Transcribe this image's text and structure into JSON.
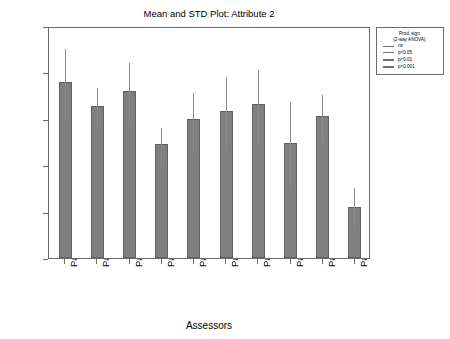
{
  "chart_data": {
    "type": "bar",
    "title": "Mean and STD Plot: Attribute 2",
    "xlabel": "Assessors",
    "ylabel": "Score",
    "ylim": [
      0,
      100
    ],
    "yticks": [
      0,
      20,
      40,
      60,
      80,
      100
    ],
    "grid": false,
    "legend_position": "outside-top-right",
    "categories": [
      "Panellist 1",
      "Panellist 2",
      "Panellist 3",
      "Panellist 4",
      "Panellist 5",
      "Panellist 6",
      "Panellist 7",
      "Panellist 8",
      "Panellist 9",
      "Panellist 10"
    ],
    "values": [
      76,
      65.5,
      72,
      49,
      60,
      63.5,
      66.5,
      49.5,
      61,
      22
    ],
    "error_low": [
      61,
      57,
      60,
      41,
      47,
      48,
      50,
      31,
      51,
      14
    ],
    "error_high": [
      91,
      74,
      85,
      57,
      72,
      79,
      82,
      68,
      71,
      31
    ],
    "bar_color": "#808080",
    "bar_edge_color": "#5f5f5f",
    "error_bar_color": "#8a8a8a"
  },
  "legend": {
    "title_line_1": "Prod. sign.",
    "title_line_2": "(2-way ANOVA):",
    "entries": [
      {
        "label": "ns",
        "weight": 0.6
      },
      {
        "label": "p<0.05",
        "weight": 1.0
      },
      {
        "label": "p<0.01",
        "weight": 1.6
      },
      {
        "label": "p<0.001",
        "weight": 2.4
      }
    ]
  }
}
